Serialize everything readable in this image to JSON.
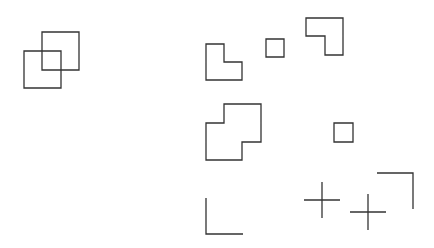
{
  "canvas": {
    "width": 434,
    "height": 248,
    "background": "#ffffff"
  },
  "style": {
    "stroke": "#333333",
    "stroke_width": 1.3
  },
  "shapes": [
    {
      "name": "overlap-square-back",
      "type": "polygon",
      "points": "42,32 79,32 79,70 42,70"
    },
    {
      "name": "overlap-square-front",
      "type": "polygon",
      "points": "24,51 61,51 61,88 24,88"
    },
    {
      "name": "l-shape",
      "type": "polygon",
      "points": "206,44 224,44 224,62 242,62 242,80 206,80"
    },
    {
      "name": "small-square-top",
      "type": "polygon",
      "points": "266,39 284,39 284,57 266,57"
    },
    {
      "name": "reverse-l-shape",
      "type": "polygon",
      "points": "306,18 343,18 343,55 325,55 325,36 306,36"
    },
    {
      "name": "step-shape",
      "type": "polygon",
      "points": "224,104 261,104 261,142 242,142 242,160 206,160 206,123 224,123"
    },
    {
      "name": "small-square-middle",
      "type": "polygon",
      "points": "334,123 353,123 353,142 334,142"
    },
    {
      "name": "corner-bottom-left",
      "type": "polyline",
      "points": "206,198 206,234 243,234"
    },
    {
      "name": "cross-left",
      "type": "cross",
      "cx": 322,
      "cy": 200,
      "half": 18
    },
    {
      "name": "cross-right",
      "type": "cross",
      "cx": 368,
      "cy": 212,
      "half": 18
    },
    {
      "name": "corner-top-right",
      "type": "polyline",
      "points": "377,173 413,173 413,209"
    }
  ]
}
